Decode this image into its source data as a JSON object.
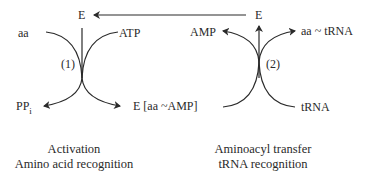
{
  "diagram": {
    "reaction1": {
      "step_label": "(1)",
      "enzyme": "E",
      "inputs": [
        "aa",
        "ATP"
      ],
      "outputs": [
        "PP",
        "E [aa ~AMP]"
      ],
      "pp_subscript": "i",
      "caption_line1": "Activation",
      "caption_line2": "Amino acid recognition"
    },
    "reaction2": {
      "step_label": "(2)",
      "enzyme": "E",
      "inputs": [
        "E [aa ~AMP]",
        "tRNA"
      ],
      "outputs": [
        "AMP",
        "aa ~ tRNA"
      ],
      "caption_line1": "Aminoacyl transfer",
      "caption_line2": "tRNA recognition"
    },
    "recycle_arrow": "E returned from reaction (2) to reaction (1)"
  }
}
